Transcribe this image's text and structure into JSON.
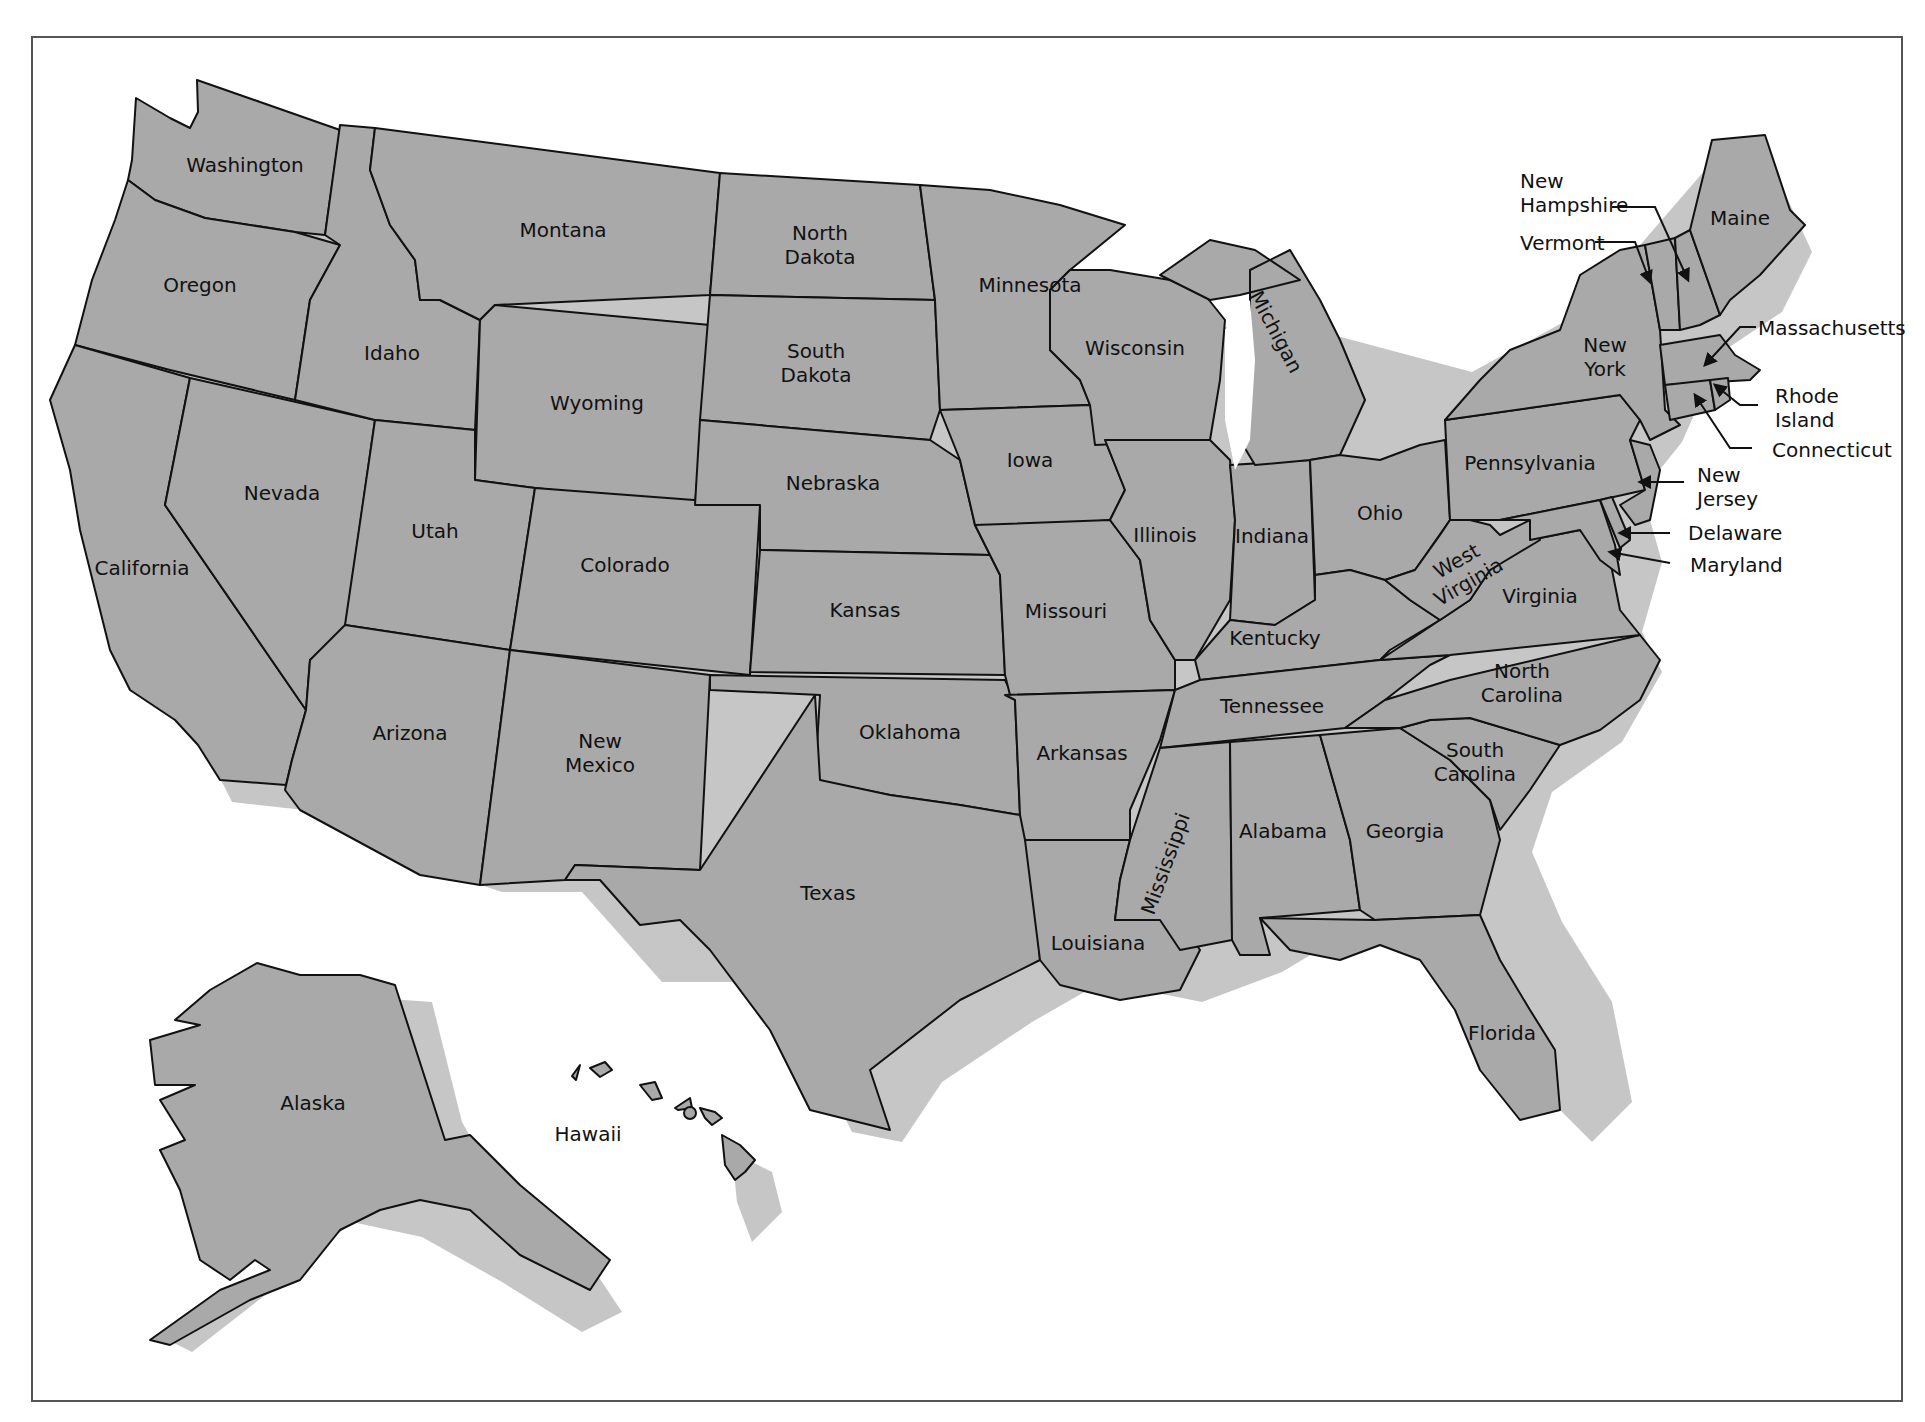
{
  "map": {
    "title": "United States",
    "colors": {
      "state_fill": "#a9a9a9",
      "shadow": "#c6c6c6",
      "border": "#111111",
      "background": "#ffffff"
    },
    "states": [
      {
        "name": "Washington",
        "label": [
          "Washington"
        ],
        "x": 245,
        "y": 172
      },
      {
        "name": "Oregon",
        "label": [
          "Oregon"
        ],
        "x": 200,
        "y": 292
      },
      {
        "name": "California",
        "label": [
          "California"
        ],
        "x": 142,
        "y": 575
      },
      {
        "name": "Nevada",
        "label": [
          "Nevada"
        ],
        "x": 282,
        "y": 500
      },
      {
        "name": "Idaho",
        "label": [
          "Idaho"
        ],
        "x": 392,
        "y": 360
      },
      {
        "name": "Montana",
        "label": [
          "Montana"
        ],
        "x": 563,
        "y": 237
      },
      {
        "name": "Wyoming",
        "label": [
          "Wyoming"
        ],
        "x": 597,
        "y": 410
      },
      {
        "name": "Utah",
        "label": [
          "Utah"
        ],
        "x": 435,
        "y": 538
      },
      {
        "name": "Arizona",
        "label": [
          "Arizona"
        ],
        "x": 410,
        "y": 740
      },
      {
        "name": "Colorado",
        "label": [
          "Colorado"
        ],
        "x": 625,
        "y": 572
      },
      {
        "name": "New Mexico",
        "label": [
          "New",
          "Mexico"
        ],
        "x": 600,
        "y": 748
      },
      {
        "name": "North Dakota",
        "label": [
          "North",
          "Dakota"
        ],
        "x": 820,
        "y": 240
      },
      {
        "name": "South Dakota",
        "label": [
          "South",
          "Dakota"
        ],
        "x": 816,
        "y": 358
      },
      {
        "name": "Nebraska",
        "label": [
          "Nebraska"
        ],
        "x": 833,
        "y": 490
      },
      {
        "name": "Kansas",
        "label": [
          "Kansas"
        ],
        "x": 865,
        "y": 617
      },
      {
        "name": "Oklahoma",
        "label": [
          "Oklahoma"
        ],
        "x": 910,
        "y": 739
      },
      {
        "name": "Texas",
        "label": [
          "Texas"
        ],
        "x": 828,
        "y": 900
      },
      {
        "name": "Minnesota",
        "label": [
          "Minnesota"
        ],
        "x": 1030,
        "y": 292
      },
      {
        "name": "Iowa",
        "label": [
          "Iowa"
        ],
        "x": 1030,
        "y": 467
      },
      {
        "name": "Missouri",
        "label": [
          "Missouri"
        ],
        "x": 1066,
        "y": 618
      },
      {
        "name": "Arkansas",
        "label": [
          "Arkansas"
        ],
        "x": 1082,
        "y": 760
      },
      {
        "name": "Louisiana",
        "label": [
          "Louisiana"
        ],
        "x": 1098,
        "y": 950
      },
      {
        "name": "Wisconsin",
        "label": [
          "Wisconsin"
        ],
        "x": 1135,
        "y": 355
      },
      {
        "name": "Illinois",
        "label": [
          "Illinois"
        ],
        "x": 1165,
        "y": 542
      },
      {
        "name": "Indiana",
        "label": [
          "Indiana"
        ],
        "x": 1272,
        "y": 543
      },
      {
        "name": "Ohio",
        "label": [
          "Ohio"
        ],
        "x": 1380,
        "y": 520
      },
      {
        "name": "Kentucky",
        "label": [
          "Kentucky"
        ],
        "x": 1275,
        "y": 645
      },
      {
        "name": "Tennessee",
        "label": [
          "Tennessee"
        ],
        "x": 1272,
        "y": 713
      },
      {
        "name": "Alabama",
        "label": [
          "Alabama"
        ],
        "x": 1283,
        "y": 838
      },
      {
        "name": "Georgia",
        "label": [
          "Georgia"
        ],
        "x": 1405,
        "y": 838
      },
      {
        "name": "Florida",
        "label": [
          "Florida"
        ],
        "x": 1502,
        "y": 1040
      },
      {
        "name": "South Carolina",
        "label": [
          "South",
          "Carolina"
        ],
        "x": 1475,
        "y": 757
      },
      {
        "name": "North Carolina",
        "label": [
          "North",
          "Carolina"
        ],
        "x": 1522,
        "y": 678
      },
      {
        "name": "Virginia",
        "label": [
          "Virginia"
        ],
        "x": 1540,
        "y": 603
      },
      {
        "name": "Pennsylvania",
        "label": [
          "Pennsylvania"
        ],
        "x": 1530,
        "y": 470
      },
      {
        "name": "New York",
        "label": [
          "New",
          "York"
        ],
        "x": 1605,
        "y": 352
      },
      {
        "name": "Maine",
        "label": [
          "Maine"
        ],
        "x": 1740,
        "y": 225
      },
      {
        "name": "Alaska",
        "label": [
          "Alaska"
        ],
        "x": 313,
        "y": 1110
      }
    ],
    "rotated_labels": [
      {
        "name": "Michigan",
        "text": "Michigan",
        "x": 1270,
        "y": 335,
        "rotate": 62
      },
      {
        "name": "Mississippi",
        "text": "Mississippi",
        "x": 1172,
        "y": 866,
        "rotate": -70
      },
      {
        "name": "West Virginia",
        "text": [
          "West",
          "Virginia"
        ],
        "x": 1460,
        "y": 567,
        "rotate": -30
      }
    ],
    "callouts": [
      {
        "name": "New Hampshire",
        "text": [
          "New",
          "Hampshire"
        ],
        "x": 1520,
        "y": 188
      },
      {
        "name": "Vermont",
        "text": [
          "Vermont"
        ],
        "x": 1520,
        "y": 250
      },
      {
        "name": "Massachusetts",
        "text": [
          "Massachusetts"
        ],
        "x": 1758,
        "y": 335
      },
      {
        "name": "Rhode Island",
        "text": [
          "Rhode",
          "Island"
        ],
        "x": 1775,
        "y": 403
      },
      {
        "name": "Connecticut",
        "text": [
          "Connecticut"
        ],
        "x": 1772,
        "y": 457
      },
      {
        "name": "New Jersey",
        "text": [
          "New",
          "Jersey"
        ],
        "x": 1697,
        "y": 482
      },
      {
        "name": "Delaware",
        "text": [
          "Delaware"
        ],
        "x": 1688,
        "y": 540
      },
      {
        "name": "Maryland",
        "text": [
          "Maryland"
        ],
        "x": 1690,
        "y": 572
      }
    ],
    "hawaii": {
      "label": "Hawaii",
      "x": 588,
      "y": 1141
    }
  }
}
